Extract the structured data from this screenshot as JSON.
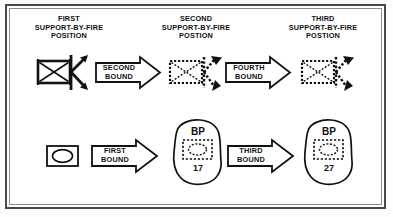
{
  "figure": {
    "title_absent": true,
    "background_color": "#ffffff",
    "frame_color": "#4a4a4a",
    "ink_color": "#111111"
  },
  "labels": {
    "first_position": "FIRST\nSUPPORT-BY-FIRE\nPOSITION",
    "second_position": "SECOND\nSUPPORT-BY-FIRE\nPOSTION",
    "third_position": "THIRD\nSUPPORT-BY-FIRE\nPOSTION"
  },
  "bounds": {
    "second": "SECOND\nBOUND",
    "fourth": "FOURTH\nBOUND",
    "first": "FIRST\nBOUND",
    "third": "THIRD\nBOUND"
  },
  "battle_positions": [
    {
      "label": "BP",
      "number": "17"
    },
    {
      "label": "BP",
      "number": "27"
    }
  ],
  "symbols": {
    "support_by_fire_solid": "armor-unit-solid-icon",
    "support_by_fire_dashed": "armor-unit-dashed-icon",
    "sbf_arrow_solid": "support-by-fire-arrow-solid-icon",
    "sbf_arrow_dashed": "support-by-fire-arrow-dashed-icon",
    "maneuver_unit": "mechanized-unit-icon",
    "bound_arrow": "bound-arrow-icon"
  }
}
